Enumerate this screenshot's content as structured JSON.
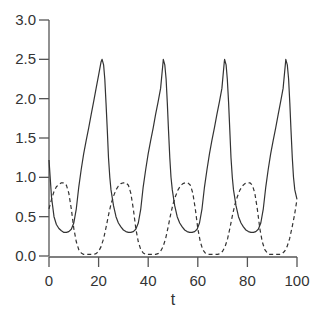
{
  "chart_data": {
    "type": "line",
    "title": "",
    "xlabel": "t",
    "ylabel": "",
    "xlim": [
      0,
      100
    ],
    "ylim": [
      0,
      3
    ],
    "xticks": [
      0,
      20,
      40,
      60,
      80,
      100
    ],
    "yticks": [
      0.0,
      0.5,
      1.0,
      1.5,
      2.0,
      2.5,
      3.0
    ],
    "xtick_labels": [
      "0",
      "20",
      "40",
      "60",
      "80",
      "100"
    ],
    "ytick_labels": [
      "0.0",
      "0.5",
      "1.0",
      "1.5",
      "2.0",
      "2.5",
      "3.0"
    ],
    "grid": false,
    "legend": null,
    "series": [
      {
        "name": "solid",
        "style": "solid",
        "color": "#333333",
        "t": [
          0,
          1,
          2,
          3,
          4,
          5,
          6,
          7,
          8,
          9,
          10,
          11,
          12,
          13,
          14,
          15,
          16,
          17,
          18,
          19,
          20,
          21,
          21.4,
          22,
          22.5,
          23,
          23.5,
          24,
          24.5,
          25,
          26,
          27,
          28,
          29,
          30,
          31,
          32,
          33,
          34,
          35,
          36,
          37,
          38,
          39,
          40,
          41,
          42,
          43,
          44,
          45,
          46,
          46.1,
          46.7,
          47.2,
          47.7,
          48.2,
          48.7,
          49.2,
          49.7,
          50.7,
          51.7,
          52.7,
          53.7,
          54.7,
          55.7,
          56.7,
          57.7,
          58.7,
          59.7,
          60.7,
          61.7,
          62.7,
          63.7,
          64.7,
          65.7,
          66.7,
          67.7,
          68.7,
          69.7,
          70.7,
          70.8,
          71.4,
          71.9,
          72.4,
          72.9,
          73.4,
          73.9,
          74.4,
          75.4,
          76.4,
          77.4,
          78.4,
          79.4,
          80.4,
          81.4,
          82.4,
          83.4,
          84.4,
          85.4,
          86.4,
          87.4,
          88.4,
          89.4,
          90.4,
          91.4,
          92.4,
          93.4,
          94.4,
          95.4,
          95.5,
          96.1,
          96.6,
          97.1,
          97.6,
          98.1,
          98.6,
          99.1,
          100
        ],
        "values": [
          1.22,
          0.75,
          0.5,
          0.4,
          0.35,
          0.32,
          0.3,
          0.3,
          0.31,
          0.34,
          0.42,
          0.6,
          0.88,
          1.1,
          1.3,
          1.47,
          1.63,
          1.8,
          1.96,
          2.13,
          2.3,
          2.47,
          2.5,
          2.43,
          2.25,
          1.95,
          1.6,
          1.25,
          1.0,
          0.84,
          0.64,
          0.5,
          0.42,
          0.37,
          0.33,
          0.31,
          0.3,
          0.3,
          0.31,
          0.34,
          0.42,
          0.6,
          0.88,
          1.1,
          1.3,
          1.47,
          1.63,
          1.8,
          1.96,
          2.13,
          2.47,
          2.5,
          2.43,
          2.25,
          1.95,
          1.6,
          1.25,
          1.0,
          0.84,
          0.64,
          0.5,
          0.42,
          0.37,
          0.33,
          0.31,
          0.3,
          0.3,
          0.31,
          0.34,
          0.42,
          0.6,
          0.88,
          1.1,
          1.3,
          1.47,
          1.63,
          1.8,
          1.96,
          2.13,
          2.47,
          2.5,
          2.43,
          2.25,
          1.95,
          1.6,
          1.25,
          1.0,
          0.84,
          0.64,
          0.5,
          0.42,
          0.37,
          0.33,
          0.31,
          0.3,
          0.3,
          0.31,
          0.34,
          0.42,
          0.6,
          0.88,
          1.1,
          1.3,
          1.47,
          1.63,
          1.8,
          1.96,
          2.13,
          2.47,
          2.5,
          2.43,
          2.25,
          1.95,
          1.6,
          1.25,
          1.0,
          0.84,
          0.72
        ]
      },
      {
        "name": "dashed",
        "style": "dashed",
        "color": "#333333",
        "t": [
          0,
          1,
          2,
          3,
          4,
          5,
          6,
          7,
          8,
          9,
          10,
          11,
          12,
          13,
          14,
          15,
          16,
          17,
          18,
          19,
          20,
          21,
          22,
          23,
          24,
          25,
          26,
          27,
          28,
          29,
          30,
          31,
          32,
          33,
          34,
          35,
          36,
          37,
          38,
          39,
          40,
          41,
          42,
          43,
          44,
          45,
          46,
          47,
          48,
          49,
          50,
          51,
          52,
          53,
          54,
          55,
          56,
          57,
          58,
          59,
          60,
          61,
          62,
          63,
          64,
          65,
          66,
          67,
          68,
          69,
          70,
          71,
          72,
          73,
          74,
          75,
          76,
          77,
          78,
          79,
          80,
          81,
          82,
          83,
          84,
          85,
          86,
          87,
          88,
          89,
          90,
          91,
          92,
          93,
          94,
          95,
          96,
          97,
          98,
          99,
          100
        ],
        "values": [
          0.6,
          0.72,
          0.82,
          0.88,
          0.91,
          0.93,
          0.93,
          0.9,
          0.8,
          0.6,
          0.35,
          0.18,
          0.08,
          0.04,
          0.02,
          0.02,
          0.02,
          0.02,
          0.02,
          0.03,
          0.06,
          0.12,
          0.22,
          0.36,
          0.52,
          0.66,
          0.76,
          0.84,
          0.89,
          0.92,
          0.93,
          0.93,
          0.9,
          0.8,
          0.6,
          0.35,
          0.18,
          0.08,
          0.04,
          0.02,
          0.02,
          0.02,
          0.02,
          0.02,
          0.03,
          0.06,
          0.12,
          0.22,
          0.36,
          0.52,
          0.66,
          0.76,
          0.84,
          0.89,
          0.92,
          0.93,
          0.93,
          0.9,
          0.8,
          0.6,
          0.35,
          0.18,
          0.08,
          0.04,
          0.02,
          0.02,
          0.02,
          0.02,
          0.02,
          0.03,
          0.06,
          0.12,
          0.22,
          0.36,
          0.52,
          0.66,
          0.76,
          0.84,
          0.89,
          0.92,
          0.93,
          0.93,
          0.9,
          0.8,
          0.6,
          0.35,
          0.18,
          0.08,
          0.04,
          0.02,
          0.02,
          0.02,
          0.02,
          0.02,
          0.03,
          0.06,
          0.12,
          0.22,
          0.36,
          0.52,
          0.72
        ]
      }
    ]
  }
}
